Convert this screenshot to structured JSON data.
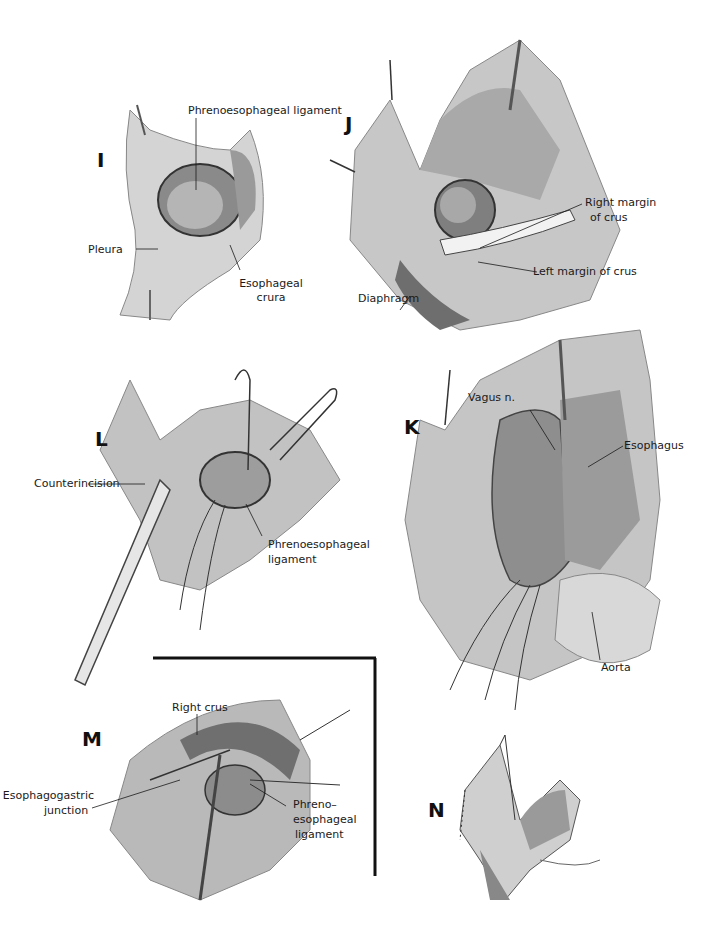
{
  "figure": {
    "panels": [
      {
        "id": "I",
        "letter": "I",
        "labels": [
          "Phrenoesophageal ligament",
          "Pleura",
          "Esophageal",
          "crura"
        ]
      },
      {
        "id": "J",
        "letter": "J",
        "labels": [
          "Right margin",
          "of crus",
          "Left margin of crus",
          "Diaphragm"
        ]
      },
      {
        "id": "L",
        "letter": "L",
        "labels": [
          "Counterincision",
          "Phrenoesophageal",
          "ligament"
        ]
      },
      {
        "id": "K",
        "letter": "K",
        "labels": [
          "Vagus n.",
          "Esophagus",
          "Aorta"
        ]
      },
      {
        "id": "M",
        "letter": "M",
        "labels": [
          "Right crus",
          "Esophagogastric",
          "junction",
          "Phreno–",
          "esophageal",
          "ligament"
        ]
      },
      {
        "id": "N",
        "letter": "N",
        "labels": []
      }
    ]
  },
  "colors": {
    "ink": "#1a1a1a",
    "wash_light": "#d6d6d6",
    "wash_mid": "#a8a8a8",
    "wash_dark": "#6e6e6e",
    "background": "#ffffff"
  }
}
